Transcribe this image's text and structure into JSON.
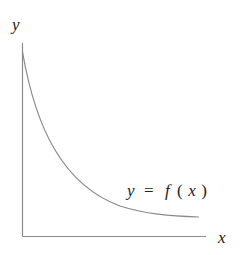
{
  "diagram": {
    "type": "function-graph",
    "axes": {
      "x_label": "x",
      "y_label": "y"
    },
    "curve": {
      "label_y": "y",
      "label_eq": "=",
      "label_f": "f",
      "label_open": "(",
      "label_x": "x",
      "label_close": ")",
      "full_label": "y = f(x)"
    },
    "colors": {
      "axis": "#8a8a8a",
      "curve": "#8a8a8a",
      "text": "#222222"
    }
  }
}
